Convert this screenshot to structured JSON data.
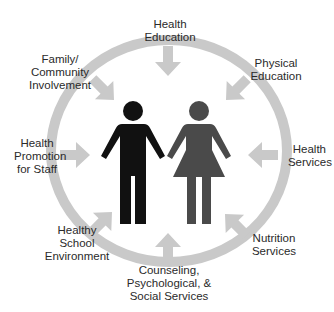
{
  "diagram": {
    "type": "hub-and-spoke",
    "center": [
      "male-figure",
      "female-figure"
    ],
    "colors": {
      "ring": "#c9c9c9",
      "arrow": "#c9c9c9",
      "male": "#111111",
      "female": "#4a4a4a",
      "text": "#2a2a2a"
    },
    "components": [
      {
        "id": "health-education",
        "lines": [
          "Health",
          "Education"
        ]
      },
      {
        "id": "physical-education",
        "lines": [
          "Physical",
          "Education"
        ]
      },
      {
        "id": "health-services",
        "lines": [
          "Health",
          "Services"
        ]
      },
      {
        "id": "nutrition-services",
        "lines": [
          "Nutrition",
          "Services"
        ]
      },
      {
        "id": "counseling",
        "lines": [
          "Counseling,",
          "Psychological, &",
          "Social Services"
        ]
      },
      {
        "id": "healthy-school-environment",
        "lines": [
          "Healthy",
          "School",
          "Environment"
        ]
      },
      {
        "id": "health-promotion-staff",
        "lines": [
          "Health",
          "Promotion",
          "for Staff"
        ]
      },
      {
        "id": "family-community",
        "lines": [
          "Family/",
          "Community",
          "Involvement"
        ]
      }
    ]
  }
}
